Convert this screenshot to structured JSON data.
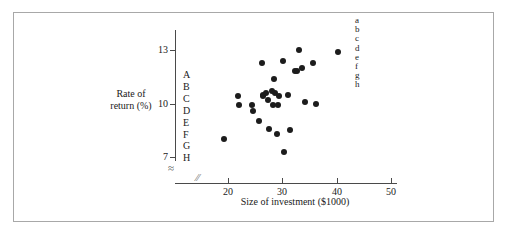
{
  "figure": {
    "border_color": "#a8a8a8",
    "background": "#ffffff",
    "point_color": "#1c1c1c",
    "axis_color": "#4a4a4a"
  },
  "chart_data": {
    "type": "scatter",
    "title": "",
    "xlabel": "Size of investment ($1000)",
    "ylabel": "Rate of return (%)",
    "xlim": [
      15,
      52
    ],
    "ylim": [
      6.4,
      14.2
    ],
    "xticks": [
      20,
      30,
      40,
      50
    ],
    "yticks": [
      7,
      10,
      13
    ],
    "xtick_labels": [
      "20",
      "30",
      "40",
      "50"
    ],
    "ytick_labels": [
      "7",
      "10",
      "13"
    ],
    "grid": false,
    "axis_break_x": true,
    "axis_break_y": true,
    "legend_position": "top-right",
    "y_axis_letters": [
      "A",
      "B",
      "C",
      "D",
      "E",
      "F",
      "G",
      "H"
    ],
    "legend_letters": [
      "a",
      "b",
      "c",
      "d",
      "e",
      "f",
      "g",
      "h"
    ],
    "x": [
      19.2,
      21.8,
      22.0,
      24.4,
      24.5,
      25.6,
      26.2,
      26.4,
      26.5,
      27.0,
      27.4,
      27.6,
      28.0,
      28.2,
      28.4,
      28.6,
      29.0,
      29.2,
      29.4,
      30.0,
      30.2,
      31.0,
      31.4,
      32.2,
      32.6,
      33.0,
      33.6,
      34.2,
      35.6,
      36.2,
      40.2
    ],
    "y": [
      8.0,
      10.4,
      9.9,
      9.9,
      9.6,
      9.0,
      12.3,
      10.4,
      10.5,
      10.6,
      10.2,
      8.6,
      10.7,
      9.9,
      11.4,
      10.6,
      8.3,
      9.9,
      10.4,
      12.4,
      7.3,
      10.5,
      8.5,
      11.8,
      11.8,
      13.0,
      12.0,
      10.1,
      12.3,
      10.0,
      12.9
    ],
    "marker": "circle",
    "marker_size": 6
  }
}
